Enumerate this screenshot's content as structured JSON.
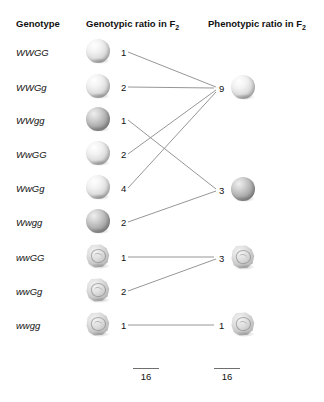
{
  "headers": {
    "genotype": "Genotype",
    "genotypic_ratio": "Genotypic ratio in F",
    "genotypic_ratio_sub": "2",
    "phenotypic_ratio": "Phenotypic ratio in F",
    "phenotypic_ratio_sub": "2"
  },
  "rows": [
    {
      "genotype": "WWGG",
      "ratio": "1",
      "seed": "round-smooth-yellow"
    },
    {
      "genotype": "WWGg",
      "ratio": "2",
      "seed": "round-smooth-yellow"
    },
    {
      "genotype": "WWgg",
      "ratio": "1",
      "seed": "round-smooth-green"
    },
    {
      "genotype": "WwGG",
      "ratio": "2",
      "seed": "round-smooth-yellow"
    },
    {
      "genotype": "WwGg",
      "ratio": "4",
      "seed": "round-smooth-yellow"
    },
    {
      "genotype": "Wwgg",
      "ratio": "2",
      "seed": "round-smooth-green"
    },
    {
      "genotype": "wwGG",
      "ratio": "1",
      "seed": "wrinkled-yellow"
    },
    {
      "genotype": "wwGg",
      "ratio": "2",
      "seed": "wrinkled-yellow"
    },
    {
      "genotype": "wwgg",
      "ratio": "1",
      "seed": "wrinkled-green"
    }
  ],
  "phenotypes": [
    {
      "ratio": "9",
      "seed": "round-smooth-yellow"
    },
    {
      "ratio": "3",
      "seed": "round-smooth-green"
    },
    {
      "ratio": "3",
      "seed": "wrinkled-yellow"
    },
    {
      "ratio": "1",
      "seed": "wrinkled-green"
    }
  ],
  "totals": {
    "genotypic": "16",
    "phenotypic": "16"
  },
  "chart_data": {
    "type": "diagram",
    "categories": [
      "WWGG",
      "WWGg",
      "WWgg",
      "WwGG",
      "WwGg",
      "Wwgg",
      "wwGG",
      "wwGg",
      "wwgg"
    ],
    "values": [
      1,
      2,
      1,
      2,
      4,
      2,
      1,
      2,
      1
    ],
    "genotypic_total": 16,
    "phenotypic_groups": [
      {
        "label": "9",
        "value": 9,
        "members": [
          "WWGG",
          "WWGg",
          "WwGG",
          "WwGg"
        ]
      },
      {
        "label": "3",
        "value": 3,
        "members": [
          "WWgg",
          "Wwgg"
        ]
      },
      {
        "label": "3",
        "value": 3,
        "members": [
          "wwGG",
          "wwGg"
        ]
      },
      {
        "label": "1",
        "value": 1,
        "members": [
          "wwgg"
        ]
      }
    ],
    "phenotypic_total": 16,
    "phenotypic_ratio": "9:3:3:1"
  }
}
